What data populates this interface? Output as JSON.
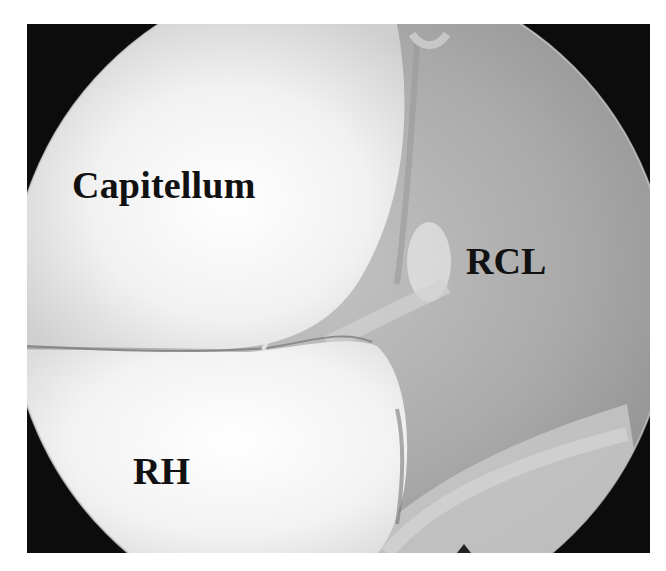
{
  "figure": {
    "labels": {
      "capitellum": "Capitellum",
      "rcl": "RCL",
      "rh": "RH"
    },
    "colors": {
      "background": "#ffffff",
      "vignette": "#0c0c0c",
      "cartilage": "#f4f4f4",
      "soft_tissue": "#a8a8a8",
      "label_text": "#111111"
    }
  }
}
